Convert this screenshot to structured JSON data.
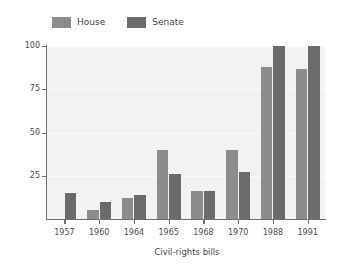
{
  "chart_data": {
    "type": "bar",
    "title": "",
    "xlabel": "Civil-rights bills",
    "ylabel": "Percentage supporting bill",
    "categories": [
      "1957",
      "1960",
      "1964",
      "1965",
      "1968",
      "1970",
      "1988",
      "1991"
    ],
    "series": [
      {
        "name": "House",
        "color": "#8c8c8c",
        "values": [
          null,
          5,
          12,
          40,
          16,
          40,
          88,
          87
        ]
      },
      {
        "name": "Senate",
        "color": "#6b6b6b",
        "values": [
          15,
          10,
          14,
          26,
          16,
          27,
          100,
          100
        ]
      }
    ],
    "ylim": [
      0,
      100
    ],
    "yticks": [
      25,
      50,
      75,
      100
    ],
    "ytick_labels": [
      "25",
      "50",
      "75",
      "100"
    ],
    "grid": true,
    "grid_axis": "y",
    "legend_position": "top-left",
    "plot_background": "#f2f2f2",
    "axis_color": "#6e6e6e",
    "text_color": "#4a4a4a"
  },
  "legend": {
    "entries": [
      {
        "label": "House",
        "color": "#8c8c8c"
      },
      {
        "label": "Senate",
        "color": "#6b6b6b"
      }
    ]
  }
}
